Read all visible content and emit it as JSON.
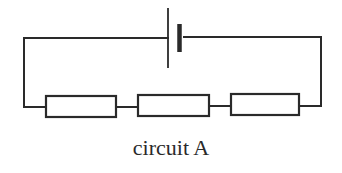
{
  "diagram": {
    "caption": "circuit A",
    "components": {
      "cell": {
        "type": "cell",
        "count": 1
      },
      "resistors": [
        {
          "id": "R1",
          "type": "resistor"
        },
        {
          "id": "R2",
          "type": "resistor"
        },
        {
          "id": "R3",
          "type": "resistor"
        }
      ]
    },
    "connection": "series",
    "colors": {
      "line": "#2a2a2a",
      "background": "#ffffff"
    }
  }
}
